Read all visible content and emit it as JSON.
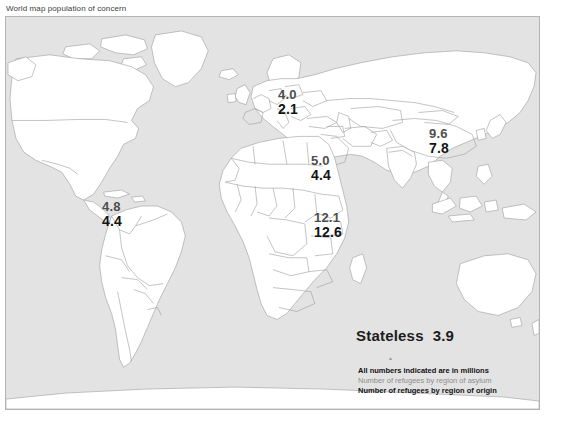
{
  "title": "World map population of concern",
  "map": {
    "ocean_color": "#e3e3e3",
    "land_color": "#ffffff",
    "border_color": "#9b9b9b",
    "frame_color": "#b4b4b4"
  },
  "regions": [
    {
      "name": "americas",
      "asylum": "4.8",
      "origin": "4.4"
    },
    {
      "name": "europe",
      "asylum": "4.0",
      "origin": "2.1"
    },
    {
      "name": "mena",
      "asylum": "5.0",
      "origin": "4.4"
    },
    {
      "name": "africa",
      "asylum": "12.1",
      "origin": "12.6"
    },
    {
      "name": "asia",
      "asylum": "9.6",
      "origin": "7.8"
    }
  ],
  "stateless": {
    "label": "Stateless",
    "value": "3.9",
    "mark": "▴"
  },
  "legend": {
    "units": "All numbers indicated are in millions",
    "asylum": "Number of refugees by region of asylum",
    "origin": "Number of refugees by region of origin"
  },
  "colors": {
    "asylum_text": "#4e4e4e",
    "origin_text": "#141414",
    "legend_asylum_text": "#8d8d8d"
  }
}
